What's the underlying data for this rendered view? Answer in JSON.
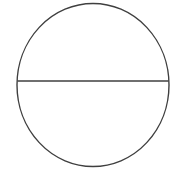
{
  "figure": {
    "caption": "",
    "background_color": "#ffffff",
    "stroke_color": "#3f3f3f",
    "stroke_width": 1.4,
    "canvas": {
      "width": 177,
      "height": 173
    },
    "shapes": {
      "circle": {
        "name": "circle-outline",
        "center_x": 93,
        "center_y": 85,
        "radius_x": 76,
        "radius_y": 81.5,
        "fill": "none"
      },
      "diameter_line": {
        "name": "horizontal-diameter-line",
        "x1": 17.5,
        "y1": 81,
        "x2": 168.5,
        "y2": 81
      }
    }
  }
}
